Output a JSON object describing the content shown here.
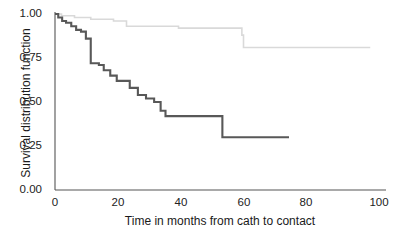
{
  "chart_data": {
    "type": "line",
    "subtype": "kaplan-meier-step",
    "title": "",
    "xlabel": "Time in months from cath to contact",
    "ylabel": "Survival distribution function",
    "xlim": [
      0,
      100
    ],
    "ylim": [
      0,
      1.0
    ],
    "xticks": [
      0,
      20,
      40,
      60,
      80,
      100
    ],
    "xtick_labels": [
      "0",
      "20",
      "40",
      "60",
      "80",
      "100"
    ],
    "yticks": [
      0.0,
      0.25,
      0.5,
      0.75,
      1.0
    ],
    "ytick_labels": [
      "0.00",
      "0.25",
      "0.50",
      "0.75",
      "1.00"
    ],
    "grid": false,
    "legend": "none",
    "spines": [
      "left",
      "bottom"
    ],
    "series": [
      {
        "name": "lower-survival-group",
        "color": "#585858",
        "linewidth": 2.1,
        "steps": [
          [
            0.0,
            1.0
          ],
          [
            1.0,
            0.98
          ],
          [
            2.2,
            0.96
          ],
          [
            3.4,
            0.95
          ],
          [
            5.0,
            0.93
          ],
          [
            6.5,
            0.91
          ],
          [
            8.0,
            0.9
          ],
          [
            9.5,
            0.86
          ],
          [
            11.0,
            0.84
          ],
          [
            11.0,
            0.72
          ],
          [
            13.5,
            0.71
          ],
          [
            15.0,
            0.68
          ],
          [
            17.0,
            0.65
          ],
          [
            19.0,
            0.62
          ],
          [
            21.0,
            0.62
          ],
          [
            23.0,
            0.58
          ],
          [
            25.5,
            0.54
          ],
          [
            28.0,
            0.52
          ],
          [
            30.5,
            0.5
          ],
          [
            32.5,
            0.45
          ],
          [
            34.0,
            0.42
          ],
          [
            51.0,
            0.42
          ],
          [
            51.5,
            0.3
          ],
          [
            72.0,
            0.3
          ]
        ],
        "final_value": 0.3,
        "end_time": 72.0
      },
      {
        "name": "higher-survival-group",
        "color": "#d9d9d9",
        "linewidth": 1.6,
        "steps": [
          [
            0.0,
            1.0
          ],
          [
            2.0,
            0.99
          ],
          [
            6.0,
            0.98
          ],
          [
            11.0,
            0.97
          ],
          [
            18.0,
            0.96
          ],
          [
            22.0,
            0.93
          ],
          [
            38.0,
            0.92
          ],
          [
            57.5,
            0.88
          ],
          [
            58.0,
            0.81
          ],
          [
            97.0,
            0.81
          ]
        ],
        "final_value": 0.81,
        "end_time": 97.0
      }
    ]
  },
  "axes": {
    "y_title": "Survival distribution function",
    "x_title": "Time in months from cath to contact"
  }
}
